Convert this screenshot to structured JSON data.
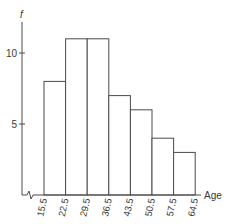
{
  "chart_data": {
    "type": "bar",
    "subtype": "histogram",
    "title": "",
    "xlabel": "Age",
    "ylabel": "f",
    "class_boundaries": [
      "15.5",
      "22.5",
      "29.5",
      "36.5",
      "43.5",
      "50.5",
      "57.5",
      "64.5"
    ],
    "categories": [
      "15.5-22.5",
      "22.5-29.5",
      "29.5-36.5",
      "36.5-43.5",
      "43.5-50.5",
      "50.5-57.5",
      "57.5-64.5"
    ],
    "values": [
      8,
      11,
      11,
      7,
      6,
      4,
      3
    ],
    "y_ticks": [
      "5",
      "10"
    ],
    "ylim": [
      0,
      12
    ],
    "grid": false,
    "legend": null,
    "axis_break": "x-axis break symbol near origin"
  },
  "colors": {
    "stroke": "#4a4a4a",
    "bar_fill": "#ffffff",
    "text": "#3a3a3a"
  }
}
